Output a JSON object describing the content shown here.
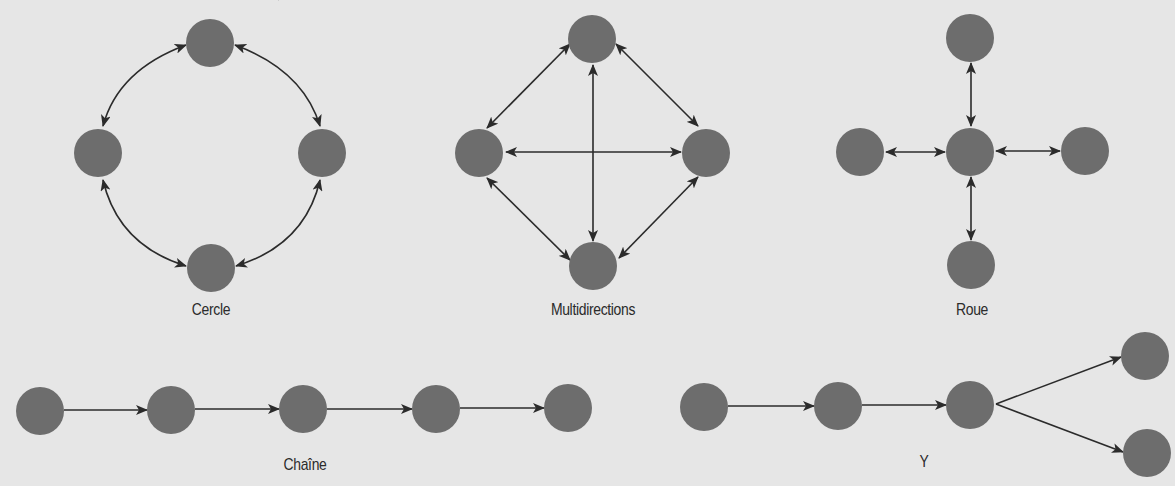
{
  "figure": {
    "background": "#e6e6e6",
    "node_color": "#6d6d6d",
    "edge_color": "#2b2b2b",
    "node_radius": 24
  },
  "diagrams": [
    {
      "id": "cercle",
      "label": "Cercle",
      "label_pos": [
        211,
        300
      ],
      "edge_style": "curved-bidirectional",
      "nodes": [
        [
          210,
          43
        ],
        [
          98,
          153
        ],
        [
          322,
          153
        ],
        [
          211,
          268
        ]
      ]
    },
    {
      "id": "multidirections",
      "label": "Multidirections",
      "label_pos": [
        593,
        300
      ],
      "edge_style": "straight-bidirectional",
      "nodes": [
        [
          592,
          39
        ],
        [
          479,
          153
        ],
        [
          706,
          153
        ],
        [
          593,
          266
        ]
      ]
    },
    {
      "id": "roue",
      "label": "Roue",
      "label_pos": [
        972,
        300
      ],
      "edge_style": "straight-bidirectional",
      "nodes": [
        [
          970,
          38
        ],
        [
          860,
          152
        ],
        [
          970,
          152
        ],
        [
          1085,
          151
        ],
        [
          971,
          265
        ]
      ]
    },
    {
      "id": "chaine",
      "label": "Chaîne",
      "label_pos": [
        305,
        455
      ],
      "edge_style": "straight-directed",
      "nodes": [
        [
          40,
          411
        ],
        [
          171,
          410
        ],
        [
          303,
          409
        ],
        [
          436,
          409
        ],
        [
          568,
          408
        ]
      ]
    },
    {
      "id": "y",
      "label": "Y",
      "label_pos": [
        924,
        452
      ],
      "edge_style": "straight-directed",
      "nodes": [
        [
          704,
          407
        ],
        [
          838,
          406
        ],
        [
          970,
          405
        ],
        [
          1145,
          356
        ],
        [
          1147,
          453
        ]
      ]
    }
  ]
}
